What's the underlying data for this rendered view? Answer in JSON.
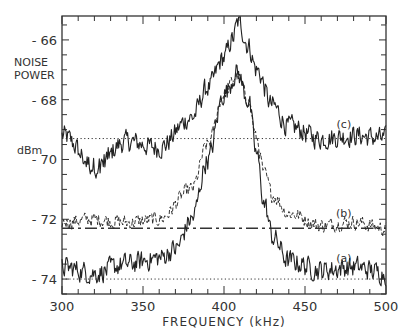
{
  "chart_data": {
    "type": "line",
    "title": "",
    "xlabel": "FREQUENCY (kHz)",
    "ylabel_lines": [
      "NOISE",
      "POWER"
    ],
    "yunit": "dBm",
    "xlim": [
      300,
      500
    ],
    "ylim": [
      -74.5,
      -65.2
    ],
    "xticks": [
      300,
      350,
      400,
      450,
      500
    ],
    "yticks": [
      -66,
      -68,
      -70,
      -72,
      -74
    ],
    "ytick_labels": [
      "-66",
      "-68",
      "-70",
      "-72",
      "-74"
    ],
    "xtick_labels": [
      "300",
      "350",
      "400",
      "450",
      "500"
    ],
    "grid": false,
    "legend": "inline curve labels",
    "series": [
      {
        "name": "(c)",
        "style": "solid noisy",
        "baseline_dBm": -69.3,
        "baseline_style": "dotted",
        "peak_freq_kHz": 409,
        "peak_dBm": -65.4,
        "width_kHz": 22,
        "x": [
          300,
          320,
          340,
          360,
          380,
          390,
          400,
          405,
          409,
          415,
          420,
          430,
          440,
          460,
          480,
          500
        ],
        "values": [
          -69.2,
          -70.2,
          -69.4,
          -69.6,
          -68.6,
          -67.6,
          -66.6,
          -66.0,
          -65.4,
          -66.2,
          -67.0,
          -68.2,
          -68.9,
          -69.3,
          -69.2,
          -69.3
        ]
      },
      {
        "name": "(b)",
        "style": "dashed noisy",
        "baseline_dBm": -72.3,
        "baseline_style": "dash-dot",
        "peak_freq_kHz": 408,
        "peak_dBm": -67.2,
        "x": [
          300,
          320,
          340,
          360,
          380,
          390,
          400,
          408,
          415,
          420,
          425,
          430,
          440,
          460,
          480,
          500
        ],
        "values": [
          -72.1,
          -72.0,
          -72.1,
          -72.0,
          -71.0,
          -69.5,
          -67.8,
          -67.2,
          -68.0,
          -69.3,
          -70.5,
          -71.2,
          -71.8,
          -72.2,
          -72.1,
          -72.3
        ]
      },
      {
        "name": "(a)",
        "style": "solid noisy",
        "baseline_dBm": -74.0,
        "baseline_style": "dotted",
        "peak_freq_kHz": 408,
        "peak_dBm": -67.1,
        "x": [
          300,
          320,
          340,
          360,
          370,
          380,
          390,
          400,
          408,
          415,
          420,
          425,
          430,
          440,
          460,
          480,
          500
        ],
        "values": [
          -73.6,
          -73.8,
          -73.5,
          -73.3,
          -73.0,
          -72.0,
          -70.0,
          -67.8,
          -67.1,
          -68.0,
          -69.8,
          -71.5,
          -72.6,
          -73.4,
          -73.7,
          -73.6,
          -73.8
        ]
      }
    ],
    "annotations": [
      {
        "text": "(c)",
        "x_kHz": 474,
        "y_dBm": -68.8
      },
      {
        "text": "(b)",
        "x_kHz": 474,
        "y_dBm": -71.8
      },
      {
        "text": "(a)",
        "x_kHz": 474,
        "y_dBm": -73.3
      }
    ]
  }
}
